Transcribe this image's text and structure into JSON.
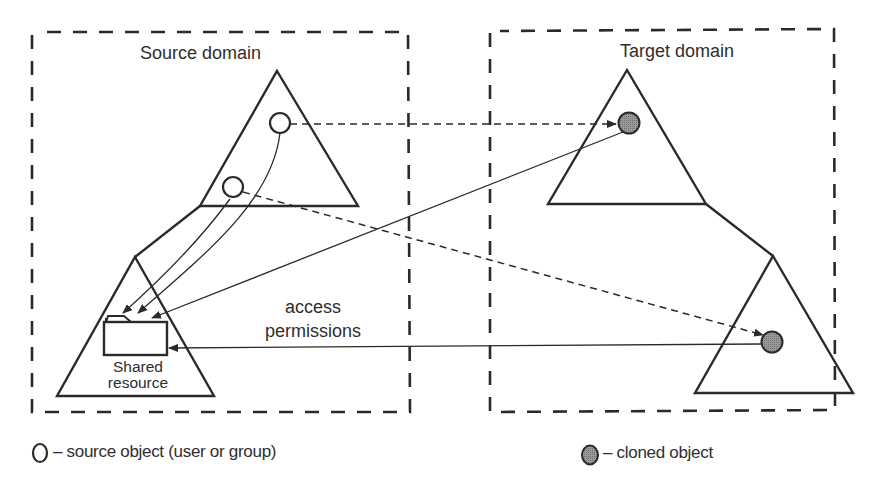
{
  "diagram": {
    "source_domain": {
      "title": "Source domain",
      "shared_resource_label_line1": "Shared",
      "shared_resource_label_line2": "resource"
    },
    "target_domain": {
      "title": "Target domain"
    },
    "edge_label_line1": "access",
    "edge_label_line2": "permissions",
    "legend": {
      "source_object": "– source  object (user or group)",
      "cloned_object": "– cloned  object"
    },
    "colors": {
      "stroke": "#2a2a2a",
      "cloned_fill": "#8e8e8e",
      "background": "#ffffff"
    }
  }
}
